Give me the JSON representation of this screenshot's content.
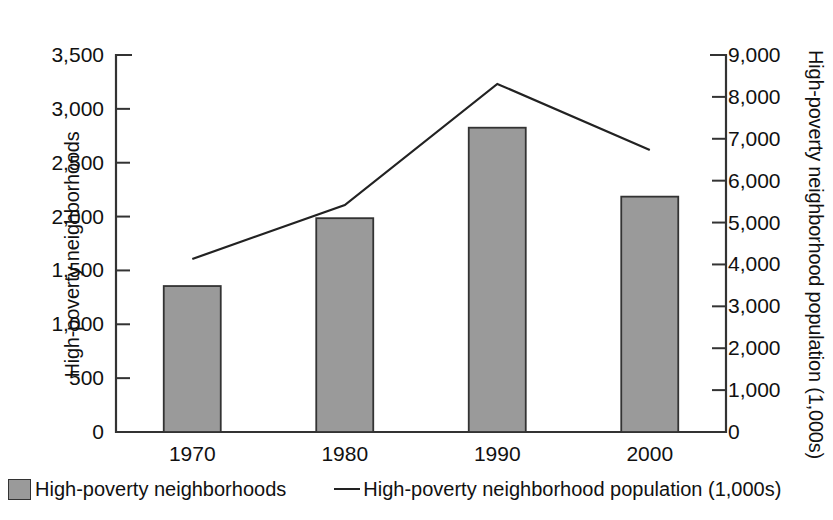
{
  "chart_data": {
    "type": "bar",
    "title": "",
    "subtitle": "",
    "xlabel": "",
    "categories": [
      "1970",
      "1980",
      "1990",
      "2000"
    ],
    "grid": false,
    "legend_position": "bottom",
    "axes": {
      "left": {
        "label": "High-poverty neighborhoods",
        "min": 0,
        "max": 3500,
        "tick_step": 500,
        "ticks": [
          "0",
          "500",
          "1,000",
          "1,500",
          "2,000",
          "2,500",
          "3,000",
          "3,500"
        ],
        "tick_values": [
          0,
          500,
          1000,
          1500,
          2000,
          2500,
          3000,
          3500
        ]
      },
      "right": {
        "label": "High-poverty neighborhood population (1,000s)",
        "min": 0,
        "max": 9000,
        "tick_step": 1000,
        "ticks": [
          "0",
          "1,000",
          "2,000",
          "3,000",
          "4,000",
          "5,000",
          "6,000",
          "7,000",
          "8,000",
          "9,000"
        ],
        "tick_values": [
          0,
          1000,
          2000,
          3000,
          4000,
          5000,
          6000,
          7000,
          8000,
          9000
        ]
      }
    },
    "series": [
      {
        "name": "High-poverty neighborhoods",
        "type": "bar",
        "axis": "left",
        "color": "#9a9a9a",
        "edge_color": "#333333",
        "values": [
          1355,
          1985,
          2825,
          2185
        ]
      },
      {
        "name": "High-poverty neighborhood population (1,000s)",
        "type": "line",
        "axis": "right",
        "color": "#222222",
        "values": [
          4130,
          5420,
          8310,
          6730
        ]
      }
    ]
  },
  "legend": {
    "items": [
      {
        "label": "High-poverty neighborhoods",
        "marker": "box-swatch-icon"
      },
      {
        "label": "High-poverty neighborhood population (1,000s)",
        "marker": "line-swatch-icon"
      }
    ]
  },
  "colors": {
    "bar_fill": "#9a9a9a",
    "bar_edge": "#333333",
    "line": "#222222",
    "axis": "#333333",
    "text": "#111111",
    "background": "#ffffff"
  }
}
